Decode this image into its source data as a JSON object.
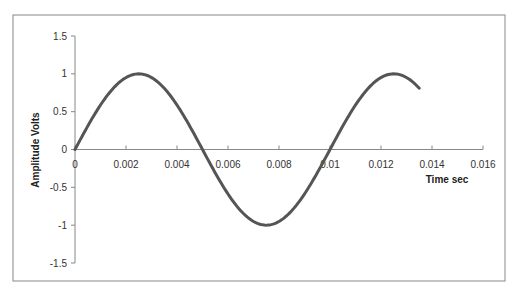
{
  "chart_data": {
    "type": "line",
    "title": "",
    "xlabel": "Time  sec",
    "ylabel": "Amplitude  Volts",
    "xlim": [
      0,
      0.016
    ],
    "ylim": [
      -1.5,
      1.5
    ],
    "x_ticks": [
      "0",
      "0.002",
      "0.004",
      "0.006",
      "0.008",
      "0.01",
      "0.012",
      "0.014",
      "0.016"
    ],
    "y_ticks": [
      "1.5",
      "1",
      "0.5",
      "0",
      "-0.5",
      "-1",
      "-1.5"
    ],
    "grid": false,
    "legend": null,
    "series": [
      {
        "name": "Amplitude",
        "description": "sine wave, 100 Hz, amplitude 1 V",
        "x": [
          0,
          0.001,
          0.002,
          0.0025,
          0.003,
          0.004,
          0.005,
          0.006,
          0.007,
          0.0075,
          0.008,
          0.009,
          0.01,
          0.011,
          0.012,
          0.0125,
          0.013,
          0.0135
        ],
        "values": [
          0,
          0.59,
          0.95,
          1.0,
          0.95,
          0.59,
          0,
          -0.59,
          -0.95,
          -1.0,
          -0.95,
          -0.59,
          0,
          0.59,
          0.95,
          1.0,
          0.95,
          0.81
        ],
        "color": "#555555"
      }
    ]
  }
}
